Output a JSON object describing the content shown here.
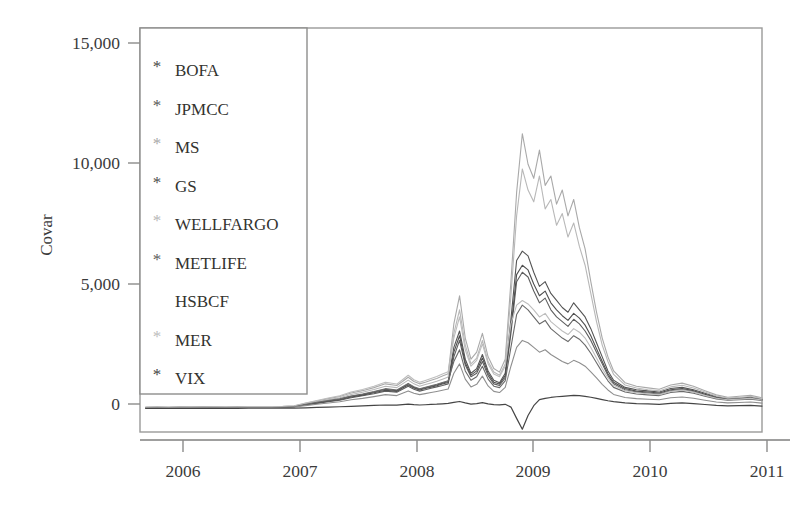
{
  "figure": {
    "background": "#ffffff",
    "frame_color": "#9a9a99"
  },
  "chart_data": {
    "type": "line",
    "title": "",
    "xlabel": "",
    "ylabel": "Covar",
    "xlim": [
      2005.55,
      2011.0
    ],
    "ylim": [
      -1000,
      16200
    ],
    "grid": false,
    "legend_position": "upper-left",
    "x_ticks": [
      "2006",
      "2007",
      "2008",
      "2009",
      "2010",
      "2011"
    ],
    "x_tick_values": [
      2006,
      2007,
      2008,
      2009,
      2010,
      2011
    ],
    "y_ticks": [
      "0",
      "5,000",
      "10,000",
      "15,000"
    ],
    "y_tick_values": [
      0,
      5000,
      10000,
      15000
    ],
    "legend": [
      {
        "label": "BOFA",
        "marker": "*",
        "color": "#4a4a4a"
      },
      {
        "label": "JPMCC",
        "marker": "*",
        "color": "#5a5a5a"
      },
      {
        "label": "MS",
        "marker": "*",
        "color": "#a9a9a9"
      },
      {
        "label": "GS",
        "marker": "*",
        "color": "#4f4f4f"
      },
      {
        "label": "WELLFARGO",
        "marker": "*",
        "color": "#b8b8b8"
      },
      {
        "label": "METLIFE",
        "marker": "*",
        "color": "#5e5e5e"
      },
      {
        "label": "HSBCF",
        "marker": "",
        "color": "#8f8f8f"
      },
      {
        "label": "MER",
        "marker": "*",
        "color": "#bdbdbd"
      },
      {
        "label": "VIX",
        "marker": "*",
        "color": "#454545"
      }
    ],
    "x": [
      2005.6,
      2005.7,
      2005.8,
      2005.9,
      2006.0,
      2006.1,
      2006.2,
      2006.3,
      2006.4,
      2006.5,
      2006.6,
      2006.7,
      2006.8,
      2006.9,
      2007.0,
      2007.1,
      2007.2,
      2007.3,
      2007.4,
      2007.5,
      2007.6,
      2007.7,
      2007.8,
      2007.85,
      2007.9,
      2007.95,
      2008.0,
      2008.05,
      2008.1,
      2008.15,
      2008.2,
      2008.25,
      2008.3,
      2008.35,
      2008.4,
      2008.45,
      2008.5,
      2008.55,
      2008.6,
      2008.65,
      2008.7,
      2008.75,
      2008.8,
      2008.85,
      2008.9,
      2008.95,
      2009.0,
      2009.05,
      2009.1,
      2009.15,
      2009.2,
      2009.25,
      2009.3,
      2009.35,
      2009.4,
      2009.45,
      2009.5,
      2009.55,
      2009.6,
      2009.65,
      2009.7,
      2009.8,
      2009.9,
      2010.0,
      2010.1,
      2010.2,
      2010.3,
      2010.4,
      2010.5,
      2010.6,
      2010.7,
      2010.8,
      2010.9,
      2011.0
    ],
    "series": [
      {
        "name": "BOFA",
        "color": "#545454",
        "width": 1.1,
        "values": [
          40,
          45,
          42,
          48,
          50,
          55,
          52,
          60,
          58,
          62,
          65,
          60,
          70,
          90,
          180,
          260,
          330,
          400,
          520,
          600,
          700,
          820,
          760,
          900,
          1050,
          900,
          820,
          880,
          950,
          1000,
          1080,
          1150,
          2600,
          3300,
          2100,
          1500,
          1700,
          2300,
          1600,
          1200,
          1100,
          1500,
          3800,
          6300,
          6700,
          6500,
          5800,
          5200,
          5400,
          4900,
          4600,
          4300,
          4100,
          4500,
          4200,
          3900,
          3400,
          2800,
          2200,
          1600,
          1200,
          900,
          800,
          750,
          700,
          850,
          900,
          800,
          650,
          500,
          420,
          450,
          480,
          400
        ]
      },
      {
        "name": "JPMCC",
        "color": "#5e5e5e",
        "width": 1.1,
        "values": [
          30,
          35,
          33,
          38,
          40,
          44,
          42,
          48,
          46,
          50,
          52,
          50,
          58,
          75,
          150,
          220,
          290,
          350,
          460,
          540,
          630,
          740,
          690,
          820,
          950,
          820,
          740,
          800,
          860,
          920,
          980,
          1050,
          2200,
          2900,
          1850,
          1350,
          1500,
          2000,
          1400,
          1050,
          980,
          1300,
          3200,
          5400,
          5800,
          5600,
          5000,
          4500,
          4700,
          4200,
          3900,
          3700,
          3500,
          3800,
          3600,
          3300,
          2900,
          2400,
          1900,
          1400,
          1050,
          800,
          700,
          660,
          620,
          760,
          810,
          720,
          580,
          450,
          380,
          400,
          430,
          360
        ]
      },
      {
        "name": "MS",
        "color": "#a9a9a9",
        "width": 1.1,
        "values": [
          55,
          58,
          56,
          62,
          65,
          70,
          68,
          75,
          72,
          78,
          82,
          78,
          88,
          110,
          220,
          320,
          420,
          510,
          660,
          760,
          890,
          1050,
          980,
          1150,
          1330,
          1150,
          1050,
          1120,
          1200,
          1280,
          1380,
          1480,
          3600,
          4800,
          3000,
          2100,
          2400,
          3200,
          2200,
          1700,
          1550,
          2100,
          5400,
          9200,
          11700,
          10400,
          9800,
          11000,
          9500,
          9900,
          8700,
          9300,
          8200,
          8900,
          7700,
          6800,
          5400,
          4100,
          3000,
          2200,
          1600,
          1100,
          950,
          880,
          820,
          1000,
          1080,
          950,
          760,
          580,
          480,
          520,
          560,
          460
        ]
      },
      {
        "name": "GS",
        "color": "#4f4f4f",
        "width": 1.1,
        "values": [
          35,
          38,
          36,
          42,
          44,
          48,
          46,
          52,
          50,
          54,
          58,
          54,
          62,
          80,
          160,
          240,
          310,
          380,
          490,
          570,
          670,
          780,
          730,
          870,
          1000,
          870,
          790,
          850,
          910,
          970,
          1040,
          1110,
          2400,
          3100,
          1950,
          1420,
          1600,
          2150,
          1500,
          1120,
          1040,
          1400,
          3400,
          5700,
          6100,
          5900,
          5300,
          4800,
          5000,
          4500,
          4200,
          3950,
          3750,
          4050,
          3850,
          3550,
          3100,
          2550,
          2000,
          1480,
          1120,
          850,
          740,
          700,
          660,
          800,
          855,
          760,
          610,
          470,
          400,
          425,
          455,
          380
        ]
      },
      {
        "name": "WELLFARGO",
        "color": "#b8b8b8",
        "width": 1.1,
        "values": [
          50,
          53,
          51,
          57,
          60,
          64,
          62,
          68,
          66,
          71,
          75,
          71,
          80,
          100,
          200,
          290,
          380,
          460,
          600,
          690,
          810,
          950,
          890,
          1050,
          1210,
          1050,
          950,
          1020,
          1090,
          1160,
          1250,
          1340,
          3200,
          4200,
          2700,
          1900,
          2150,
          2900,
          2000,
          1550,
          1420,
          1900,
          4800,
          8200,
          10200,
          9300,
          8800,
          9900,
          8500,
          8900,
          7800,
          8300,
          7300,
          7900,
          6900,
          6100,
          4900,
          3700,
          2700,
          2000,
          1450,
          1000,
          870,
          800,
          750,
          920,
          990,
          870,
          700,
          530,
          440,
          470,
          510,
          420
        ]
      },
      {
        "name": "METLIFE",
        "color": "#6a6a6a",
        "width": 1.1,
        "values": [
          45,
          48,
          46,
          52,
          54,
          58,
          56,
          62,
          60,
          64,
          68,
          64,
          72,
          92,
          185,
          265,
          340,
          410,
          530,
          615,
          720,
          845,
          790,
          930,
          1070,
          930,
          845,
          905,
          965,
          1030,
          1105,
          1180,
          2000,
          2500,
          1600,
          1200,
          1350,
          1800,
          1250,
          950,
          890,
          1180,
          2600,
          4000,
          4400,
          4200,
          3900,
          3600,
          3750,
          3400,
          3200,
          3000,
          2850,
          3100,
          2950,
          2700,
          2350,
          1950,
          1550,
          1180,
          900,
          700,
          620,
          580,
          550,
          680,
          730,
          650,
          520,
          410,
          350,
          370,
          400,
          340
        ]
      },
      {
        "name": "HSBCF",
        "color": "#8f8f8f",
        "width": 1.1,
        "values": [
          25,
          28,
          26,
          31,
          33,
          36,
          34,
          39,
          37,
          41,
          44,
          41,
          48,
          62,
          125,
          180,
          235,
          285,
          370,
          430,
          505,
          590,
          550,
          650,
          750,
          650,
          590,
          635,
          680,
          725,
          775,
          830,
          1500,
          1900,
          1250,
          920,
          1030,
          1380,
          960,
          730,
          680,
          900,
          1800,
          2600,
          2900,
          2800,
          2600,
          2400,
          2500,
          2300,
          2150,
          2000,
          1900,
          2050,
          1950,
          1800,
          1560,
          1300,
          1030,
          790,
          600,
          470,
          420,
          395,
          370,
          460,
          490,
          440,
          355,
          280,
          240,
          255,
          275,
          230
        ]
      },
      {
        "name": "MER",
        "color": "#bdbdbd",
        "width": 1.1,
        "values": [
          60,
          63,
          61,
          67,
          70,
          75,
          73,
          80,
          77,
          83,
          88,
          83,
          94,
          118,
          235,
          340,
          445,
          540,
          700,
          810,
          950,
          1115,
          1040,
          1225,
          1415,
          1225,
          1115,
          1195,
          1275,
          1360,
          1465,
          1570,
          3000,
          3900,
          2500,
          1800,
          2050,
          2750,
          1900,
          1470,
          1350,
          1800,
          3600,
          4400,
          4600,
          4450,
          4200,
          3900,
          4050,
          3700,
          3500,
          3300,
          3150,
          3400,
          3250,
          3000,
          2600,
          2150,
          1700,
          1300,
          990,
          760,
          670,
          630,
          590,
          730,
          790,
          700,
          560,
          440,
          375,
          400,
          430,
          365
        ]
      },
      {
        "name": "VIX",
        "color": "#454545",
        "width": 1.2,
        "values": [
          5,
          6,
          5,
          7,
          8,
          9,
          8,
          10,
          9,
          11,
          12,
          11,
          14,
          18,
          30,
          45,
          60,
          75,
          95,
          110,
          130,
          150,
          140,
          165,
          190,
          165,
          150,
          160,
          175,
          185,
          200,
          215,
          260,
          300,
          240,
          190,
          210,
          250,
          200,
          165,
          155,
          180,
          60,
          -420,
          -880,
          -300,
          120,
          380,
          430,
          470,
          500,
          520,
          540,
          560,
          545,
          520,
          480,
          430,
          380,
          330,
          290,
          240,
          210,
          195,
          180,
          220,
          240,
          210,
          170,
          130,
          110,
          120,
          130,
          105
        ]
      }
    ]
  }
}
